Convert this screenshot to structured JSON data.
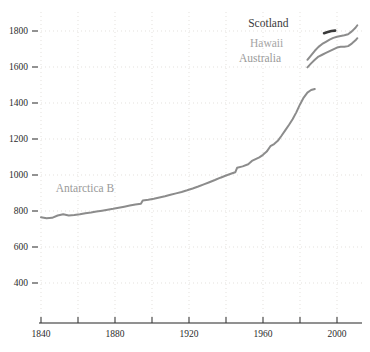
{
  "chart_data": {
    "type": "line",
    "title": "",
    "subtitle": "",
    "xlabel": "",
    "ylabel": "",
    "xlim": [
      1838,
      2012
    ],
    "ylim": [
      330,
      1870
    ],
    "grid": true,
    "legend_position": "inline-annotations",
    "x_ticks_major": [
      1840,
      1880,
      1920,
      1960,
      2000
    ],
    "x_ticks_minor": [
      1860,
      1900,
      1940,
      1980
    ],
    "x_tick_labels": [
      "1840",
      "1880",
      "1920",
      "1960",
      "2000"
    ],
    "y_ticks": [
      400,
      600,
      800,
      1000,
      1200,
      1400,
      1600,
      1800
    ],
    "y_tick_labels": [
      "400",
      "600",
      "800",
      "1000",
      "1200",
      "1400",
      "1600",
      "1800"
    ],
    "series": [
      {
        "name": "Antarctica B",
        "color": "#8c8c8c",
        "label_color": "#9a9a9a",
        "label_x": 1848,
        "label_y": 905,
        "points": [
          [
            1840,
            765
          ],
          [
            1843,
            760
          ],
          [
            1846,
            762
          ],
          [
            1849,
            775
          ],
          [
            1852,
            782
          ],
          [
            1855,
            775
          ],
          [
            1858,
            778
          ],
          [
            1861,
            782
          ],
          [
            1864,
            788
          ],
          [
            1867,
            792
          ],
          [
            1870,
            797
          ],
          [
            1873,
            802
          ],
          [
            1876,
            807
          ],
          [
            1879,
            812
          ],
          [
            1882,
            818
          ],
          [
            1885,
            824
          ],
          [
            1888,
            830
          ],
          [
            1891,
            836
          ],
          [
            1894,
            840
          ],
          [
            1895,
            858
          ],
          [
            1898,
            862
          ],
          [
            1901,
            868
          ],
          [
            1904,
            875
          ],
          [
            1907,
            882
          ],
          [
            1910,
            890
          ],
          [
            1913,
            898
          ],
          [
            1916,
            906
          ],
          [
            1919,
            915
          ],
          [
            1922,
            925
          ],
          [
            1925,
            936
          ],
          [
            1928,
            948
          ],
          [
            1931,
            960
          ],
          [
            1934,
            972
          ],
          [
            1937,
            985
          ],
          [
            1940,
            997
          ],
          [
            1943,
            1008
          ],
          [
            1945,
            1015
          ],
          [
            1946,
            1040
          ],
          [
            1949,
            1048
          ],
          [
            1952,
            1060
          ],
          [
            1954,
            1078
          ],
          [
            1956,
            1088
          ],
          [
            1958,
            1098
          ],
          [
            1960,
            1112
          ],
          [
            1962,
            1130
          ],
          [
            1964,
            1160
          ],
          [
            1966,
            1172
          ],
          [
            1968,
            1190
          ],
          [
            1970,
            1218
          ],
          [
            1972,
            1248
          ],
          [
            1974,
            1278
          ],
          [
            1976,
            1310
          ],
          [
            1978,
            1348
          ],
          [
            1980,
            1392
          ],
          [
            1982,
            1430
          ],
          [
            1984,
            1458
          ],
          [
            1986,
            1472
          ],
          [
            1988,
            1478
          ]
        ]
      },
      {
        "name": "Australia",
        "color": "#8c8c8c",
        "label_color": "#9a9a9a",
        "label_x": 1947,
        "label_y": 1630,
        "points": [
          [
            1984,
            1598
          ],
          [
            1986,
            1620
          ],
          [
            1988,
            1640
          ],
          [
            1990,
            1658
          ],
          [
            1992,
            1668
          ],
          [
            1994,
            1678
          ],
          [
            1996,
            1688
          ],
          [
            1998,
            1698
          ],
          [
            2000,
            1708
          ],
          [
            2002,
            1712
          ],
          [
            2004,
            1712
          ],
          [
            2006,
            1716
          ],
          [
            2008,
            1730
          ],
          [
            2010,
            1748
          ],
          [
            2011,
            1760
          ]
        ]
      },
      {
        "name": "Hawaii",
        "color": "#8c8c8c",
        "label_color": "#a5a5a5",
        "label_x": 1953,
        "label_y": 1712,
        "points": [
          [
            1984,
            1640
          ],
          [
            1986,
            1665
          ],
          [
            1988,
            1690
          ],
          [
            1990,
            1712
          ],
          [
            1992,
            1728
          ],
          [
            1994,
            1740
          ],
          [
            1996,
            1752
          ],
          [
            1998,
            1762
          ],
          [
            2000,
            1768
          ],
          [
            2002,
            1772
          ],
          [
            2004,
            1776
          ],
          [
            2006,
            1782
          ],
          [
            2008,
            1798
          ],
          [
            2010,
            1818
          ],
          [
            2011,
            1832
          ]
        ]
      },
      {
        "name": "Scotland",
        "color": "#3a3a3a",
        "label_color": "#3a3a3a",
        "label_x": 1952,
        "label_y": 1825,
        "points": [
          [
            1993,
            1788
          ],
          [
            1995,
            1794
          ],
          [
            1997,
            1800
          ],
          [
            1999,
            1802
          ]
        ]
      }
    ]
  }
}
